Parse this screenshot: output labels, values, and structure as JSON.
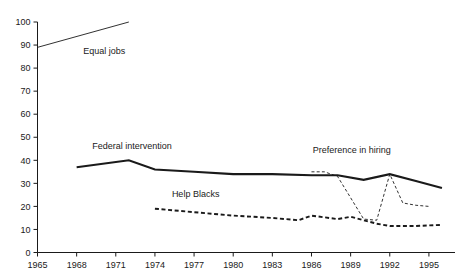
{
  "chart_data": {
    "type": "line",
    "title": "",
    "subtitle": "",
    "xlabel": "",
    "ylabel": "",
    "xlim": [
      1965,
      1997
    ],
    "ylim": [
      0,
      100
    ],
    "grid": false,
    "legend_position": "inline-annotations",
    "x_ticks": [
      "1965",
      "1968",
      "1971",
      "1974",
      "1977",
      "1980",
      "1983",
      "1986",
      "1989",
      "1992",
      "1995"
    ],
    "x_tick_values": [
      1965,
      1968,
      1971,
      1974,
      1977,
      1980,
      1983,
      1986,
      1989,
      1992,
      1995
    ],
    "y_ticks": [
      "0",
      "10",
      "20",
      "30",
      "40",
      "50",
      "60",
      "70",
      "80",
      "90",
      "100"
    ],
    "y_tick_values": [
      0,
      10,
      20,
      30,
      40,
      50,
      60,
      70,
      80,
      90,
      100
    ],
    "series": [
      {
        "name": "Equal jobs",
        "style": "solid-thin",
        "color": "#1a1a1a",
        "x": [
          1965,
          1972
        ],
        "values": [
          89,
          100
        ],
        "label": "Equal jobs",
        "label_x": 1968.5,
        "label_y": 86
      },
      {
        "name": "Federal intervention",
        "style": "solid-thick",
        "color": "#1a1a1a",
        "x": [
          1968,
          1972,
          1974,
          1977,
          1980,
          1983,
          1986,
          1988,
          1990,
          1992,
          1994,
          1996
        ],
        "values": [
          37,
          40,
          36,
          35,
          34,
          34,
          33.5,
          33.5,
          31.5,
          34,
          31,
          28
        ],
        "label": "Federal intervention",
        "label_x": 1969.2,
        "label_y": 45
      },
      {
        "name": "Help Blacks",
        "style": "dashed-thick",
        "color": "#1a1a1a",
        "x": [
          1974,
          1977,
          1980,
          1983,
          1985,
          1986,
          1988,
          1989,
          1990,
          1991,
          1992,
          1994,
          1996
        ],
        "values": [
          19,
          17.5,
          16,
          15,
          14,
          16,
          14.5,
          15.5,
          14,
          12.5,
          11.5,
          11.5,
          12
        ],
        "label": "Help Blacks",
        "label_x": 1975.3,
        "label_y": 24
      },
      {
        "name": "Preference in hiring",
        "style": "dashed-thin",
        "color": "#1a1a1a",
        "x": [
          1986,
          1987,
          1988,
          1990,
          1991,
          1992,
          1993,
          1994,
          1995
        ],
        "values": [
          35,
          35,
          33,
          14.5,
          14,
          34,
          21.5,
          20.5,
          20
        ],
        "label": "Preference in hiring",
        "label_x": 1986.1,
        "label_y": 43
      }
    ]
  },
  "axes": {
    "x_axis_name": "year-axis",
    "y_axis_name": "percent-axis"
  }
}
